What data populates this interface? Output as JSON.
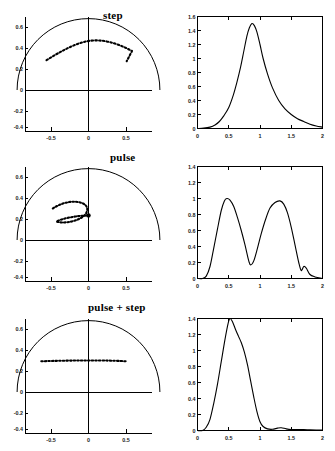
{
  "figure": {
    "caption_rows": [
      "step",
      "pulse",
      "pulse + step"
    ]
  },
  "rows": [
    {
      "title": "step",
      "left_panel": {
        "xlabels": [
          "-0.5",
          "0",
          "0.5"
        ],
        "ylabels": [
          "0.6",
          "0.4",
          "0.2",
          "0",
          "-0.2",
          "-0.4",
          "-0.6"
        ]
      },
      "right_panel": {
        "xlabels": [
          "0",
          "0.5",
          "1",
          "1.5",
          "2"
        ],
        "ylabels": [
          "1.6",
          "1.4",
          "1.2",
          "1",
          "0.8",
          "0.6",
          "0.4",
          "0.2",
          "0"
        ]
      }
    },
    {
      "title": "pulse",
      "left_panel": {
        "xlabels": [
          "-0.5",
          "0",
          "0.5"
        ],
        "ylabels": [
          "0.6",
          "0.4",
          "0.2",
          "0",
          "-0.2",
          "-0.4",
          "-0.6"
        ]
      },
      "right_panel": {
        "xlabels": [
          "0",
          "0.5",
          "1",
          "1.5",
          "2"
        ],
        "ylabels": [
          "1.4",
          "1.2",
          "1",
          "0.8",
          "0.6",
          "0.4",
          "0.2",
          "0"
        ]
      }
    },
    {
      "title": "pulse + step",
      "left_panel": {
        "xlabels": [
          "-0.5",
          "0",
          "0.5"
        ],
        "ylabels": [
          "0.6",
          "0.4",
          "0.2",
          "0",
          "-0.2",
          "-0.4",
          "-0.6"
        ]
      },
      "right_panel": {
        "xlabels": [
          "0",
          "0.5",
          "1",
          "1.5",
          "2"
        ],
        "ylabels": [
          "1.4",
          "1.2",
          "1",
          "0.8",
          "0.6",
          "0.4",
          "0.2",
          "0"
        ]
      }
    }
  ],
  "chart_data": [
    {
      "type": "scatter",
      "panel": "step-trajectory",
      "title": "step",
      "xlabel": "",
      "ylabel": "",
      "xlim": [
        -0.75,
        0.75
      ],
      "ylim": [
        -0.75,
        0.75
      ],
      "xticks": [
        -0.5,
        0,
        0.5
      ],
      "yticks": [
        -0.6,
        -0.4,
        -0.2,
        0,
        0.2,
        0.4,
        0.6
      ],
      "grid": false,
      "legend": "none",
      "annotations": [
        "semicircular workspace boundary of radius 0.68 centered at origin"
      ],
      "series": [
        {
          "name": "workspace boundary",
          "style": "solid-semicircle",
          "radius": 0.68,
          "center": [
            0,
            0
          ],
          "angle_range_deg": [
            0,
            180
          ]
        },
        {
          "name": "hand trajectory (dotted)",
          "style": "dotted",
          "x": [
            -0.4,
            -0.355,
            -0.31,
            -0.265,
            -0.22,
            -0.175,
            -0.13,
            -0.085,
            -0.04,
            0.005,
            0.05,
            0.095,
            0.14,
            0.185,
            0.23,
            0.275,
            0.32,
            0.365
          ],
          "y": [
            0.285,
            0.315,
            0.345,
            0.375,
            0.4,
            0.42,
            0.435,
            0.447,
            0.452,
            0.452,
            0.447,
            0.437,
            0.422,
            0.4,
            0.373,
            0.34,
            0.305,
            0.268
          ]
        }
      ]
    },
    {
      "type": "line",
      "panel": "step-velocity",
      "title": "",
      "xlabel": "",
      "ylabel": "",
      "xlim": [
        0,
        2
      ],
      "ylim": [
        0,
        1.6
      ],
      "xticks": [
        0,
        0.5,
        1,
        1.5,
        2
      ],
      "yticks": [
        0,
        0.2,
        0.4,
        0.6,
        0.8,
        1.0,
        1.2,
        1.4,
        1.6
      ],
      "grid": false,
      "legend": "none",
      "annotations": [
        "single asymmetric peak of 1.5 at x = 0.87 with long right tail"
      ],
      "x": [
        0,
        0.1,
        0.2,
        0.28,
        0.35,
        0.42,
        0.5,
        0.57,
        0.63,
        0.69,
        0.74,
        0.79,
        0.83,
        0.87,
        0.91,
        0.95,
        1.0,
        1.05,
        1.12,
        1.2,
        1.3,
        1.4,
        1.5,
        1.6,
        1.7,
        1.8,
        1.9,
        2.0
      ],
      "y": [
        0.0,
        0.005,
        0.02,
        0.05,
        0.1,
        0.18,
        0.3,
        0.47,
        0.66,
        0.88,
        1.1,
        1.32,
        1.44,
        1.5,
        1.47,
        1.38,
        1.2,
        1.0,
        0.78,
        0.58,
        0.4,
        0.28,
        0.2,
        0.14,
        0.1,
        0.06,
        0.035,
        0.02
      ]
    },
    {
      "type": "scatter",
      "panel": "pulse-trajectory",
      "title": "pulse",
      "xlabel": "",
      "ylabel": "",
      "xlim": [
        -0.75,
        0.75
      ],
      "ylim": [
        -0.75,
        0.75
      ],
      "xticks": [
        -0.5,
        0,
        0.5
      ],
      "yticks": [
        -0.6,
        -0.4,
        -0.2,
        0,
        0.2,
        0.4,
        0.6
      ],
      "grid": false,
      "legend": "none",
      "annotations": [
        "narrow looping (lasso) trajectory that returns toward the origin side"
      ],
      "series": [
        {
          "name": "workspace boundary",
          "style": "solid-semicircle",
          "radius": 0.68,
          "center": [
            0,
            0
          ],
          "angle_range_deg": [
            0,
            180
          ]
        },
        {
          "name": "hand trajectory (dotted loop)",
          "style": "dotted",
          "x": [
            -0.34,
            -0.3,
            -0.26,
            -0.22,
            -0.18,
            -0.14,
            -0.1,
            -0.06,
            -0.03,
            -0.01,
            -0.02,
            -0.05,
            -0.09,
            -0.13,
            -0.17,
            -0.21,
            -0.25,
            -0.28,
            -0.3,
            -0.27,
            -0.22,
            -0.16,
            -0.1,
            -0.05,
            -0.02,
            0.0
          ],
          "y": [
            0.3,
            0.325,
            0.345,
            0.358,
            0.366,
            0.368,
            0.364,
            0.352,
            0.335,
            0.315,
            0.295,
            0.278,
            0.266,
            0.258,
            0.253,
            0.251,
            0.252,
            0.258,
            0.266,
            0.27,
            0.272,
            0.274,
            0.276,
            0.278,
            0.28,
            0.282
          ]
        }
      ]
    },
    {
      "type": "line",
      "panel": "pulse-velocity",
      "title": "",
      "xlabel": "",
      "ylabel": "",
      "xlim": [
        0,
        2
      ],
      "ylim": [
        0,
        1.4
      ],
      "xticks": [
        0,
        0.5,
        1,
        1.5,
        2
      ],
      "yticks": [
        0,
        0.2,
        0.4,
        0.6,
        0.8,
        1.0,
        1.2,
        1.4
      ],
      "grid": false,
      "legend": "none",
      "annotations": [
        "bimodal profile: first peak 1.0 at x=0.47, trough 0.17 at x=0.85, second peak 0.97 at x=1.32, small bump 0.15 at x=1.70"
      ],
      "x": [
        0,
        0.08,
        0.14,
        0.2,
        0.26,
        0.32,
        0.38,
        0.43,
        0.47,
        0.52,
        0.58,
        0.64,
        0.7,
        0.76,
        0.82,
        0.85,
        0.9,
        0.96,
        1.02,
        1.09,
        1.16,
        1.24,
        1.32,
        1.38,
        1.44,
        1.5,
        1.56,
        1.62,
        1.66,
        1.7,
        1.74,
        1.8,
        1.88,
        1.94,
        2.0
      ],
      "y": [
        0.0,
        0.0,
        0.03,
        0.15,
        0.38,
        0.62,
        0.85,
        0.97,
        1.0,
        0.98,
        0.9,
        0.76,
        0.6,
        0.42,
        0.22,
        0.17,
        0.22,
        0.38,
        0.56,
        0.74,
        0.88,
        0.95,
        0.97,
        0.93,
        0.82,
        0.64,
        0.42,
        0.2,
        0.1,
        0.15,
        0.13,
        0.05,
        0.02,
        0.01,
        0.0
      ]
    },
    {
      "type": "scatter",
      "panel": "pulse-step-trajectory",
      "title": "pulse + step",
      "xlabel": "",
      "ylabel": "",
      "xlim": [
        -0.75,
        0.75
      ],
      "ylim": [
        -0.75,
        0.75
      ],
      "xticks": [
        -0.5,
        0,
        0.5
      ],
      "yticks": [
        -0.6,
        -0.4,
        -0.2,
        0,
        0.2,
        0.4,
        0.6
      ],
      "grid": false,
      "legend": "none",
      "annotations": [
        "nearly straight horizontal dotted trajectory at y = 0.29"
      ],
      "series": [
        {
          "name": "workspace boundary",
          "style": "solid-semicircle",
          "radius": 0.68,
          "center": [
            0,
            0
          ],
          "angle_range_deg": [
            0,
            180
          ]
        },
        {
          "name": "hand trajectory (dotted)",
          "style": "dotted",
          "x": [
            -0.45,
            -0.4,
            -0.35,
            -0.3,
            -0.25,
            -0.2,
            -0.15,
            -0.1,
            -0.05,
            0.0,
            0.05,
            0.1,
            0.15,
            0.2,
            0.25,
            0.3,
            0.35
          ],
          "y": [
            0.288,
            0.289,
            0.29,
            0.291,
            0.292,
            0.293,
            0.293,
            0.294,
            0.294,
            0.294,
            0.293,
            0.293,
            0.292,
            0.291,
            0.29,
            0.289,
            0.288
          ]
        }
      ]
    },
    {
      "type": "line",
      "panel": "pulse-step-velocity",
      "title": "",
      "xlabel": "",
      "ylabel": "",
      "xlim": [
        0,
        2
      ],
      "ylim": [
        0,
        1.4
      ],
      "xticks": [
        0,
        0.5,
        1,
        1.5,
        2
      ],
      "yticks": [
        0,
        0.2,
        0.4,
        0.6,
        0.8,
        1.0,
        1.2,
        1.4
      ],
      "grid": false,
      "legend": "none",
      "annotations": [
        "single sharp peak of 1.4 at x=0.52 with a small residual ripple near x=1.3"
      ],
      "x": [
        0,
        0.08,
        0.14,
        0.2,
        0.26,
        0.32,
        0.38,
        0.44,
        0.49,
        0.52,
        0.56,
        0.61,
        0.66,
        0.7,
        0.75,
        0.8,
        0.85,
        0.9,
        0.95,
        1.0,
        1.05,
        1.12,
        1.2,
        1.28,
        1.34,
        1.42,
        1.5,
        1.6,
        1.7,
        1.8,
        1.9,
        2.0
      ],
      "y": [
        0.0,
        0.0,
        0.04,
        0.14,
        0.34,
        0.58,
        0.86,
        1.14,
        1.34,
        1.4,
        1.36,
        1.26,
        1.17,
        1.1,
        0.98,
        0.82,
        0.62,
        0.42,
        0.24,
        0.11,
        0.05,
        0.02,
        0.015,
        0.03,
        0.035,
        0.02,
        0.012,
        0.012,
        0.012,
        0.008,
        0.006,
        0.005
      ]
    }
  ]
}
